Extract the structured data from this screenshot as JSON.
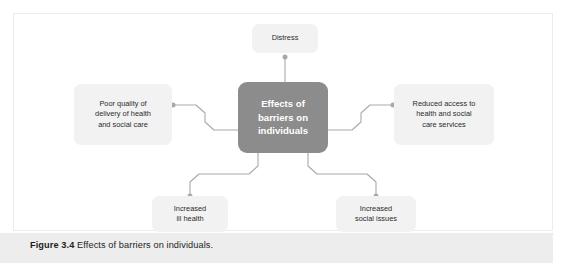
{
  "figure": {
    "caption_label": "Figure 3.4",
    "caption_text": " Effects of barriers on individuals."
  },
  "diagram": {
    "type": "mind-map",
    "center": {
      "id": "effects-of-barriers-on-individuals",
      "label": "Effects of\nbarriers on\nindividuals"
    },
    "branches": [
      {
        "id": "distress",
        "label": "Distress",
        "position": "top"
      },
      {
        "id": "poor-quality-of-delivery",
        "label": "Poor quality of\ndelivery of health\nand social care",
        "position": "left"
      },
      {
        "id": "reduced-access",
        "label": "Reduced access to\nhealth and social\ncare services",
        "position": "right"
      },
      {
        "id": "increased-ill-health",
        "label": "Increased\nill health",
        "position": "bottom-left"
      },
      {
        "id": "increased-social-issues",
        "label": "Increased\nsocial issues",
        "position": "bottom-right"
      }
    ]
  },
  "colors": {
    "center_fill": "#8c8c8c",
    "center_text": "#ffffff",
    "branch_fill": "#f2f2f3",
    "branch_text": "#2b2b2b",
    "connector": "#a9a9ac",
    "caption_band": "#ededee",
    "frame_border": "#ececed"
  }
}
